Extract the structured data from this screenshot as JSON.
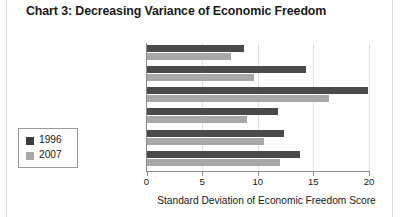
{
  "title": "Chart 3: Decreasing Variance of Economic Freedom",
  "legend": {
    "entries": [
      {
        "label": "1996",
        "color": "#3d3d3d"
      },
      {
        "label": "2007",
        "color": "#a8a8a8"
      }
    ]
  },
  "axis": {
    "x_title": "Standard Deviation of Economic Freedom Score",
    "ticks": [
      "0",
      "5",
      "10",
      "15",
      "20"
    ]
  },
  "chart_data": {
    "type": "bar",
    "orientation": "horizontal",
    "title": "Chart 3: Decreasing Variance of Economic Freedom",
    "xlabel": "Standard Deviation of Economic Freedom Score",
    "ylabel": "",
    "xlim": [
      0,
      20
    ],
    "xticks": [
      0,
      5,
      10,
      15,
      20
    ],
    "grid": true,
    "legend_position": "left-outside",
    "categories": [
      "Sub-Saharan Africa",
      "Middle East/North Africa",
      "Asia",
      "Europe",
      "Americas",
      "World"
    ],
    "series": [
      {
        "name": "1996",
        "color": "#4a4a4a",
        "values": [
          8.8,
          14.3,
          19.9,
          11.8,
          12.4,
          13.8
        ]
      },
      {
        "name": "2007",
        "color": "#a8a8a8",
        "values": [
          7.6,
          9.7,
          16.4,
          9.0,
          10.6,
          12.0
        ]
      }
    ]
  }
}
